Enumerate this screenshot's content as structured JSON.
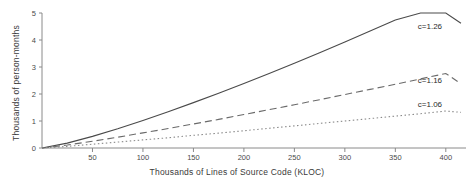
{
  "chart_data": {
    "type": "line",
    "title": "",
    "xlabel": "Thousands of Lines of Source Code (KLOC)",
    "ylabel": "Thousands of person-months",
    "xlim": [
      0,
      420
    ],
    "ylim": [
      0,
      5
    ],
    "xticks": [
      50,
      100,
      150,
      200,
      250,
      300,
      350,
      400
    ],
    "yticks": [
      0,
      1,
      2,
      3,
      4,
      5
    ],
    "grid": false,
    "legend_position": "inline-right",
    "series": [
      {
        "name": "c=1.26",
        "style": "solid",
        "x": [
          0,
          25,
          50,
          75,
          100,
          125,
          150,
          175,
          200,
          225,
          250,
          275,
          300,
          325,
          350,
          375,
          400,
          415
        ],
        "values": [
          0,
          0.18,
          0.43,
          0.71,
          1.02,
          1.34,
          1.68,
          2.03,
          2.39,
          2.76,
          3.14,
          3.53,
          3.93,
          4.33,
          4.74,
          5.15,
          5.57,
          4.62
        ]
      },
      {
        "name": "c=1.16",
        "style": "dashed",
        "x": [
          0,
          25,
          50,
          75,
          100,
          125,
          150,
          175,
          200,
          225,
          250,
          275,
          300,
          325,
          350,
          375,
          400,
          415
        ],
        "values": [
          0,
          0.11,
          0.25,
          0.4,
          0.56,
          0.72,
          0.89,
          1.06,
          1.24,
          1.42,
          1.6,
          1.79,
          1.98,
          2.17,
          2.36,
          2.56,
          2.76,
          2.38
        ]
      },
      {
        "name": "c=1.06",
        "style": "dotted",
        "x": [
          0,
          25,
          50,
          75,
          100,
          125,
          150,
          175,
          200,
          225,
          250,
          275,
          300,
          325,
          350,
          375,
          400,
          415
        ],
        "values": [
          0,
          0.06,
          0.14,
          0.22,
          0.3,
          0.38,
          0.47,
          0.55,
          0.64,
          0.73,
          0.82,
          0.91,
          1.0,
          1.09,
          1.18,
          1.27,
          1.37,
          1.32
        ]
      }
    ],
    "annotations": [
      {
        "text": "c=1.26",
        "x": 400,
        "y": 4.45
      },
      {
        "text": "c=1.16",
        "x": 400,
        "y": 2.45
      },
      {
        "text": "c=1.06",
        "x": 400,
        "y": 1.55
      }
    ],
    "colors": {
      "axis": "#8a8a8a",
      "solid_series": "#4a4a4a",
      "dashed_series": "#6a6a6a",
      "dotted_series": "#8a8a8a",
      "background": "#ffffff",
      "text": "#2b2b2b"
    }
  }
}
